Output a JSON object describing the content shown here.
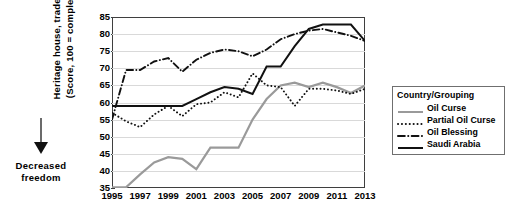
{
  "annotations": {
    "decreased_freedom": "Decreased\nfreedom",
    "decreased_freedom_line1": "Decreased",
    "decreased_freedom_line2": "freedom"
  },
  "legend": {
    "title": "Country/Grouping",
    "entries": [
      {
        "label": "Oil Curse",
        "style": "solid-gray",
        "color": "#9a9a9a"
      },
      {
        "label": "Partial Oil Curse",
        "style": "dotted-black",
        "color": "#111111"
      },
      {
        "label": "Oil Blessing",
        "style": "dash-dot-black",
        "color": "#111111"
      },
      {
        "label": "Saudi Arabia",
        "style": "solid-black",
        "color": "#111111"
      }
    ]
  },
  "chart_data": {
    "type": "line",
    "title": "",
    "xlabel": "",
    "ylabel_line1": "Heritage house, trade  freedom",
    "ylabel_line2": "(Score, 100 = completely free)",
    "grid": true,
    "legend_position": "right",
    "xlim": [
      1995,
      2013
    ],
    "ylim": [
      35,
      85
    ],
    "ytick_step": 5,
    "yticks": [
      35,
      40,
      45,
      50,
      55,
      60,
      65,
      70,
      75,
      80,
      85
    ],
    "xticks": [
      1995,
      1997,
      1999,
      2001,
      2003,
      2005,
      2007,
      2009,
      2011,
      2013
    ],
    "x": [
      1995,
      1996,
      1997,
      1998,
      1999,
      2000,
      2001,
      2002,
      2003,
      2004,
      2005,
      2006,
      2007,
      2008,
      2009,
      2010,
      2011,
      2012,
      2013
    ],
    "series": [
      {
        "name": "Oil Curse",
        "color": "#9a9a9a",
        "style": "solid",
        "values": [
          35.2,
          35.2,
          39.0,
          42.5,
          44.0,
          43.5,
          40.5,
          46.8,
          46.8,
          46.8,
          55.0,
          61.0,
          65.0,
          65.8,
          64.5,
          65.8,
          64.5,
          62.8,
          65.0
        ]
      },
      {
        "name": "Partial Oil Curse",
        "color": "#111111",
        "style": "dotted",
        "values": [
          57.0,
          54.5,
          52.8,
          56.5,
          59.0,
          56.0,
          59.5,
          60.0,
          63.0,
          61.5,
          68.5,
          65.0,
          64.5,
          59.0,
          64.0,
          64.0,
          63.5,
          62.5,
          64.0
        ]
      },
      {
        "name": "Oil Blessing",
        "color": "#111111",
        "style": "dash-dot",
        "values": [
          55.0,
          69.5,
          69.5,
          72.0,
          73.0,
          69.0,
          72.5,
          74.5,
          75.5,
          75.0,
          73.5,
          75.5,
          78.5,
          80.0,
          81.0,
          81.5,
          80.5,
          79.5,
          78.0
        ]
      },
      {
        "name": "Saudi Arabia",
        "color": "#111111",
        "style": "solid",
        "values": [
          59.0,
          59.0,
          59.0,
          59.0,
          59.0,
          59.0,
          61.0,
          63.0,
          64.5,
          64.0,
          62.5,
          70.5,
          70.5,
          76.5,
          81.5,
          82.8,
          82.8,
          82.8,
          78.0
        ]
      }
    ]
  }
}
